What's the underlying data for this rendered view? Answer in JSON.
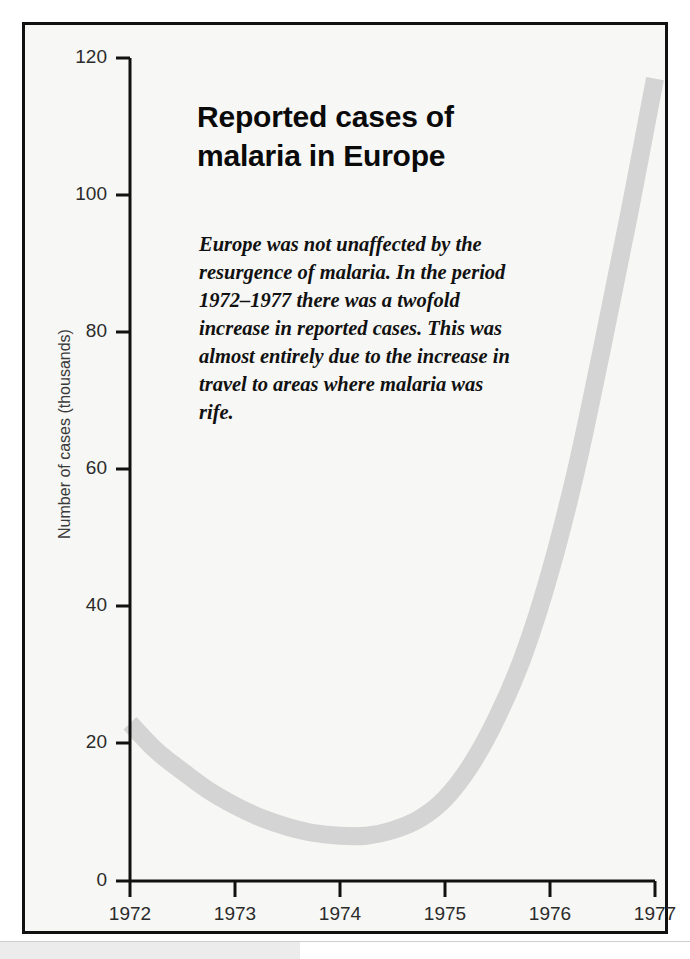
{
  "figure": {
    "title": "Reported cases of\nmalaria in Europe",
    "title_line1": "Reported cases of",
    "title_line2": "malaria in Europe",
    "note": "Europe was not unaffected by the resurgence of malaria. In the period 1972–1977 there was a twofold increase in reported cases. This was almost entirely due to the increase in travel to areas where malaria was rife.",
    "frame_color": "#111111",
    "background_color": "#f7f7f5"
  },
  "chart_data": {
    "type": "line",
    "title": "Reported cases of malaria in Europe",
    "xlabel": "",
    "ylabel": "Number of cases (thousands)",
    "xlim": [
      1972,
      1977
    ],
    "ylim": [
      0,
      120
    ],
    "grid": false,
    "legend": null,
    "series_color": "#d4d4d4",
    "line_width_px": 18,
    "x_tick_labels": [
      "1972",
      "1973",
      "1974",
      "1975",
      "1976",
      "1977"
    ],
    "x_ticks": [
      1972,
      1973,
      1974,
      1975,
      1976,
      1977
    ],
    "y_tick_labels": [
      "0",
      "20",
      "40",
      "60",
      "80",
      "100",
      "120"
    ],
    "y_ticks": [
      0,
      20,
      40,
      60,
      80,
      100,
      120
    ],
    "series": [
      {
        "name": "Reported cases of malaria in Europe",
        "x": [
          1972.0,
          1972.25,
          1972.5,
          1972.75,
          1973.0,
          1973.25,
          1973.5,
          1973.75,
          1974.0,
          1974.25,
          1974.5,
          1974.75,
          1975.0,
          1975.25,
          1975.5,
          1975.75,
          1976.0,
          1976.25,
          1976.5,
          1976.75,
          1977.0
        ],
        "values": [
          23.0,
          19.0,
          16.0,
          13.2,
          11.0,
          9.2,
          7.9,
          7.0,
          6.6,
          6.6,
          7.4,
          9.0,
          12.0,
          17.0,
          24.0,
          33.0,
          45.0,
          60.0,
          78.0,
          97.0,
          117.0
        ]
      }
    ],
    "annotations": [
      {
        "kind": "title",
        "text": "Reported cases of malaria in Europe"
      },
      {
        "kind": "note",
        "text": "Europe was not unaffected by the resurgence of malaria. In the period 1972–1977 there was a twofold increase in reported cases. This was almost entirely due to the increase in travel to areas where malaria was rife."
      }
    ]
  },
  "axes": {
    "y_axis_title": "Number of cases (thousands)",
    "y_tick_labels": [
      "120",
      "100",
      "80",
      "60",
      "40",
      "20",
      "0"
    ],
    "x_tick_labels": [
      "1972",
      "1973",
      "1974",
      "1975",
      "1976",
      "1977"
    ]
  }
}
